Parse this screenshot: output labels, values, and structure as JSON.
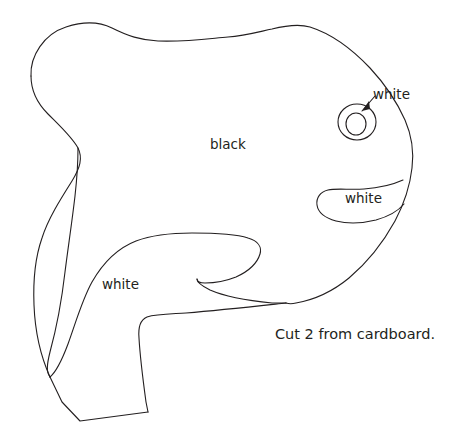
{
  "document": {
    "type": "craft-pattern-template",
    "title": "Penguin cut-out pattern",
    "background_color": "#ffffff",
    "ink_color": "#231f20",
    "line_width": 1.1
  },
  "labels": {
    "black_region": "black",
    "white_eye": "white",
    "white_mouth": "white",
    "white_belly": "white"
  },
  "caption": {
    "text": "Cut 2 from cardboard."
  },
  "shapes": {
    "body_outline": {
      "name": "body-outline",
      "path": "M 31 76 C 30 56 44 34 66 27 C 84 21 100 22 112 28 C 128 36 140 40 158 41 C 186 42 206 39 228 37 C 244 36 258 32 272 29 C 288 25 300 24 310 27 C 332 34 352 49 370 68 C 384 83 396 100 405 120 C 412 136 414 152 412 168 C 410 186 404 204 395 221 C 384 241 368 262 349 278 C 332 292 313 300 296 303 C 292 304 289 304 286 303 L 286 303"
    },
    "body_outline_lower": {
      "name": "body-outline-lower-left",
      "path": "M 286 303 C 258 306 222 310 186 313 C 170 314 156 314 147 317 C 140 320 138 327 139 338 C 140 356 143 380 146 402 L 148 412"
    },
    "foot": {
      "name": "foot-bottom",
      "path": "M 148 412 L 80 421 L 62 402 L 50 377"
    },
    "left_outer_edge": {
      "name": "left-outer-edge",
      "path": "M 31 76 C 31 92 38 104 48 114 C 60 126 72 137 78 148 C 83 158 80 168 72 181 C 60 200 48 219 42 238 C 35 258 33 281 34 305 C 35 331 41 357 50 377"
    },
    "inner_back_curve": {
      "name": "inner-back-curve",
      "path": "M 78 148 C 78 162 77 178 75 196 C 72 222 68 248 65 272 C 62 298 56 330 50 352 C 47 364 46 372 50 377"
    },
    "belly_curve": {
      "name": "belly-curve",
      "path": "M 50 377 C 56 372 62 360 68 344 C 76 322 82 300 92 282 C 104 261 118 248 136 241 C 152 235 172 233 192 233 C 214 233 236 234 248 238 C 258 241 262 247 260 254 C 257 264 247 272 236 277 C 226 281 214 283 205 283 C 200 283 197 282 197 279"
    },
    "flipper_fold": {
      "name": "flipper-fold",
      "path": "M 197 279 C 197 282 202 286 210 290 C 226 297 252 301 272 303 C 278 303 283 303 286 303"
    },
    "mouth": {
      "name": "mouth-outline",
      "path": "M 403 180 C 392 185 378 188 364 189 C 350 190 336 188 328 190 C 320 192 316 198 317 205 C 318 212 325 218 336 221 C 348 224 364 223 376 220 C 390 216 399 210 404 204"
    },
    "eye_outer": {
      "name": "eye-outer-circle",
      "cx": 357,
      "cy": 122,
      "rx": 19,
      "ry": 18
    },
    "eye_inner": {
      "name": "eye-inner-circle",
      "cx": 356,
      "cy": 124,
      "rx": 10,
      "ry": 11
    },
    "eye_pointer": {
      "name": "eye-pointer-leader-line",
      "path": "M 375 96 L 362 111"
    },
    "eye_pointer_head": {
      "name": "eye-pointer-arrowhead",
      "points": "362,111 369,101 370,109"
    }
  }
}
